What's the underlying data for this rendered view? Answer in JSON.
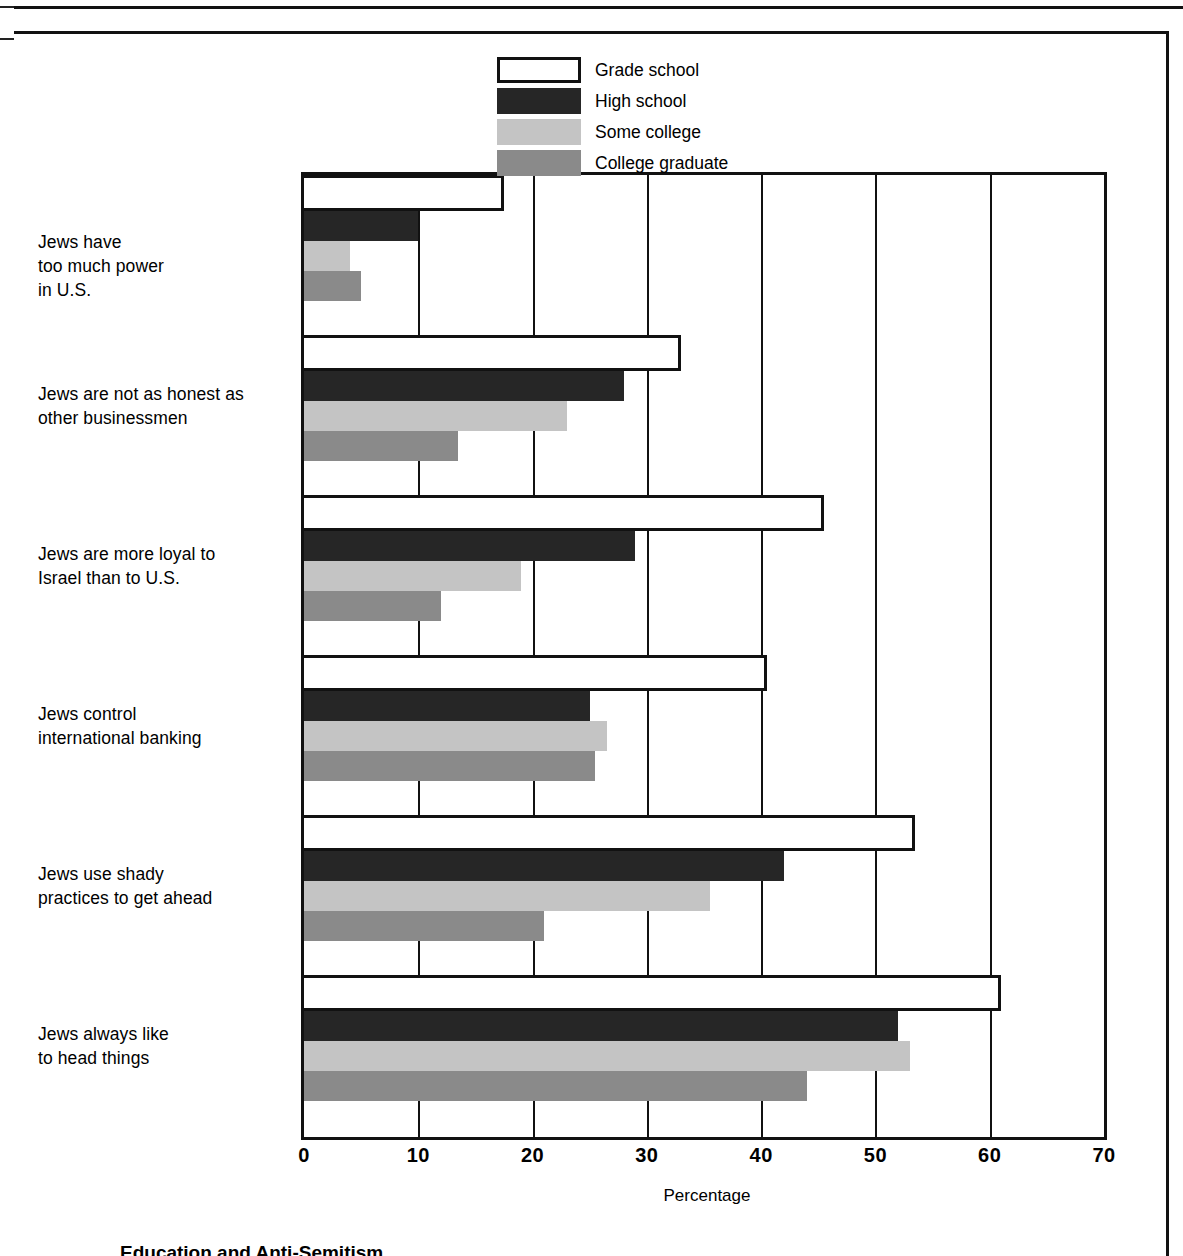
{
  "chart_data": {
    "type": "bar",
    "orientation": "horizontal",
    "title": "",
    "xlabel": "Percentage",
    "ylabel": "",
    "xlim": [
      0,
      70
    ],
    "xticks": [
      0,
      10,
      20,
      30,
      40,
      50,
      60,
      70
    ],
    "grid": true,
    "legend_position": "top-right",
    "categories": [
      "Jews have\ntoo much power\nin U.S.",
      "Jews are not as honest as\nother businessmen",
      "Jews are more loyal to\nIsrael than to U.S.",
      "Jews control\ninternational banking",
      "Jews use shady\npractices to get ahead",
      "Jews always like\nto head things"
    ],
    "series": [
      {
        "name": "Grade school",
        "color": "#ffffff",
        "values": [
          17.5,
          33.0,
          45.5,
          40.5,
          53.5,
          61.0
        ]
      },
      {
        "name": "High school",
        "color": "#262626",
        "values": [
          10.0,
          28.0,
          29.0,
          25.0,
          42.0,
          52.0
        ]
      },
      {
        "name": "Some college",
        "color": "#c4c4c4",
        "values": [
          4.0,
          23.0,
          19.0,
          26.5,
          35.5,
          53.0
        ]
      },
      {
        "name": "College graduate",
        "color": "#8a8a8a",
        "values": [
          5.0,
          13.5,
          12.0,
          25.5,
          21.0,
          44.0
        ]
      }
    ]
  },
  "axis": {
    "x_title": "Percentage",
    "tick_labels": [
      "0",
      "10",
      "20",
      "30",
      "40",
      "50",
      "60",
      "70"
    ]
  },
  "legend": {
    "items": [
      {
        "label": "Grade school"
      },
      {
        "label": "High school"
      },
      {
        "label": "Some college"
      },
      {
        "label": "College graduate"
      }
    ]
  },
  "categories_display": [
    {
      "lines": [
        "Jews have",
        "too much power",
        "in U.S."
      ]
    },
    {
      "lines": [
        "Jews are not as honest as",
        "other businessmen"
      ]
    },
    {
      "lines": [
        "Jews are more loyal to",
        "Israel than to U.S."
      ]
    },
    {
      "lines": [
        "Jews control",
        "international banking"
      ]
    },
    {
      "lines": [
        "Jews use shady",
        "practices to get ahead"
      ]
    },
    {
      "lines": [
        "Jews always like",
        "to head things"
      ]
    }
  ],
  "category_lines": {
    "c0l0": "Jews have",
    "c0l1": "too much power",
    "c0l2": "in U.S.",
    "c1l0": "Jews are not as honest as",
    "c1l1": "other businessmen",
    "c2l0": "Jews are more loyal to",
    "c2l1": "Israel than to U.S.",
    "c3l0": "Jews control",
    "c3l1": "international banking",
    "c4l0": "Jews use shady",
    "c4l1": "practices to get ahead",
    "c5l0": "Jews always like",
    "c5l1": "to head things"
  },
  "caption": "Education and Anti-Semitism"
}
